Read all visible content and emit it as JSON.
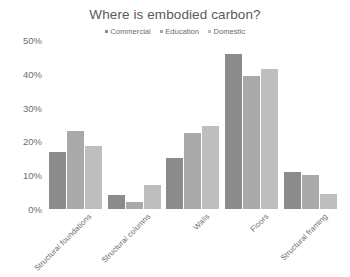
{
  "chart_data": {
    "type": "bar",
    "title": "Where is embodied carbon?",
    "xlabel": "",
    "ylabel": "",
    "ylim": [
      0,
      50
    ],
    "ytick_labels": [
      "50%",
      "40%",
      "30%",
      "20%",
      "10%",
      "0%"
    ],
    "ytick_values": [
      50,
      40,
      30,
      20,
      10,
      0
    ],
    "grid": false,
    "legend_position": "top-center",
    "categories": [
      "Structural foundations",
      "Structural columns",
      "Walls",
      "Floors",
      "Structural framing"
    ],
    "series": [
      {
        "name": "Commercial",
        "color": "#8b8b8b",
        "values": [
          17,
          4,
          15,
          46,
          11
        ]
      },
      {
        "name": "Education",
        "color": "#a9a9a9",
        "values": [
          23,
          2,
          22.5,
          39.5,
          10
        ]
      },
      {
        "name": "Domestic",
        "color": "#bebebe",
        "values": [
          18.5,
          7,
          24.5,
          41.5,
          4.5
        ]
      }
    ]
  },
  "colors": {
    "background": "#ffffff",
    "title_text": "#595959",
    "axis_text": "#6e6e6e",
    "legend_text": "#6b6b6b"
  }
}
